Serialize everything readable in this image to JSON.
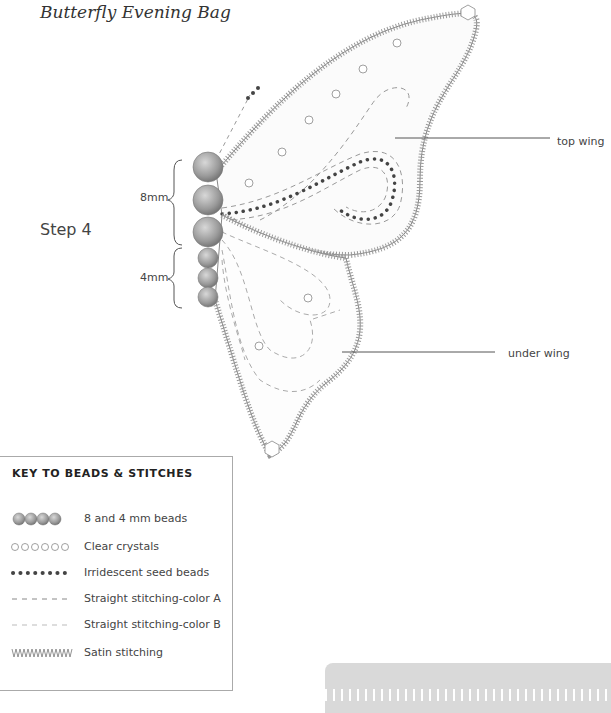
{
  "header": {
    "title": "Butterfly Evening Bag"
  },
  "diagram": {
    "step_label": "Step 4",
    "dimension_labels": {
      "large": "8mm",
      "small": "4mm"
    },
    "callouts": {
      "top_wing": "top wing",
      "under_wing": "under wing"
    },
    "colors": {
      "satin": "#777777",
      "dash_a": "#888888",
      "dash_b": "#aaaaaa",
      "seed": "#444444",
      "bead": "#999999"
    }
  },
  "key": {
    "title": "KEY TO BEADS & STITCHES",
    "items": [
      {
        "icon": "beads-icon",
        "label": "8 and 4 mm beads"
      },
      {
        "icon": "crystal-icon",
        "label": "Clear crystals"
      },
      {
        "icon": "seed-bead-icon",
        "label": "Irridescent seed beads"
      },
      {
        "icon": "dash-a-icon",
        "label": "Straight stitching-color A"
      },
      {
        "icon": "dash-b-icon",
        "label": "Straight stitching-color B"
      },
      {
        "icon": "satin-stitch-icon",
        "label": "Satin stitching"
      }
    ]
  }
}
